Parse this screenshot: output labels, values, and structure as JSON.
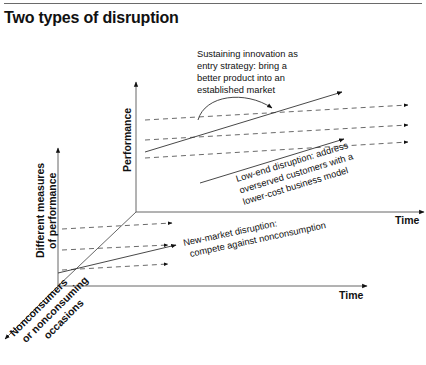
{
  "header": {
    "title": "Two types of disruption"
  },
  "diagram": {
    "axes": {
      "performance": "Performance",
      "time_upper": "Time",
      "time_lower": "Time",
      "different_measures_line1": "Different measures",
      "different_measures_line2": "of performance",
      "nonconsumers_line1": "Nonconsumers",
      "nonconsumers_line2": "or nonconsuming",
      "nonconsumers_line3": "occasions"
    },
    "annotations": {
      "sustaining": {
        "line1": "Sustaining innovation as",
        "line2": "entry strategy: bring a",
        "line3": "better product into an",
        "line4": "established market"
      },
      "low_end": {
        "line1": "Low-end disruption: address",
        "line2": "overserved customers with a",
        "line3": "lower-cost business model"
      },
      "new_market": {
        "line1": "New-market disruption:",
        "line2": "compete against nonconsumption"
      }
    },
    "colors": {
      "line": "#333333",
      "text": "#111111",
      "rule": "#6a6a6a"
    }
  }
}
